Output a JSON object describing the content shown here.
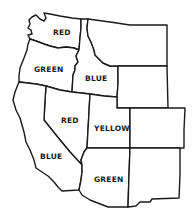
{
  "map": {
    "title": "",
    "regions": [
      {
        "id": "washington",
        "label": "RED",
        "label_x": 62,
        "label_y": 35
      },
      {
        "id": "oregon",
        "label": "GREEN",
        "label_x": 35,
        "label_y": 72
      },
      {
        "id": "idaho",
        "label": "BLUE",
        "label_x": 86,
        "label_y": 81
      },
      {
        "id": "montana",
        "label": "",
        "label_x": 0,
        "label_y": 0
      },
      {
        "id": "wyoming",
        "label": "",
        "label_x": 0,
        "label_y": 0
      },
      {
        "id": "nevada",
        "label": "RED",
        "label_x": 62,
        "label_y": 122
      },
      {
        "id": "california",
        "label": "BLUE",
        "label_x": 40,
        "label_y": 158
      },
      {
        "id": "utah",
        "label": "YELLOW",
        "label_x": 94,
        "label_y": 130
      },
      {
        "id": "colorado",
        "label": "",
        "label_x": 0,
        "label_y": 0
      },
      {
        "id": "arizona",
        "label": "GREEN",
        "label_x": 94,
        "label_y": 182
      },
      {
        "id": "new-mexico",
        "label": "",
        "label_x": 0,
        "label_y": 0
      }
    ],
    "colors": {
      "stroke": "#1a1a1a",
      "fill": "#ffffff",
      "background": "#ffffff"
    }
  }
}
